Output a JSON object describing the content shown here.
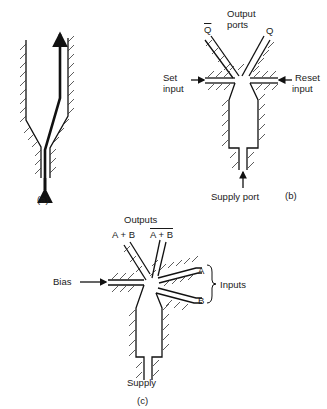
{
  "figure": {
    "a": {
      "caption": "(a)"
    },
    "b": {
      "caption": "(b)",
      "output_ports_label_1": "Output",
      "output_ports_label_2": "ports",
      "q_bar": "Q",
      "q": "Q",
      "set_input_1": "Set",
      "set_input_2": "input",
      "reset_input_1": "Reset",
      "reset_input_2": "input",
      "supply_port": "Supply port"
    },
    "c": {
      "caption": "(c)",
      "outputs_label": "Outputs",
      "output_or": "A + B",
      "output_nor": "A + B",
      "bias": "Bias",
      "input_a": "A",
      "input_b": "B",
      "inputs_label": "Inputs",
      "supply": "Supply"
    }
  },
  "colors": {
    "line": "#111111",
    "hatch": "#333333",
    "background": "#ffffff"
  }
}
